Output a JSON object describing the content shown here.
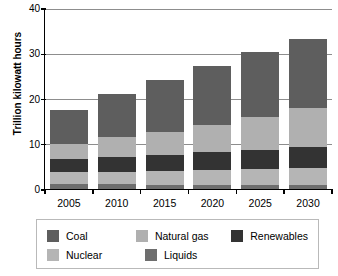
{
  "chart_data": {
    "type": "bar",
    "stacked": true,
    "title": "",
    "xlabel": "",
    "ylabel": "Trillion kilowatt hours",
    "categories": [
      "2005",
      "2010",
      "2015",
      "2020",
      "2025",
      "2030"
    ],
    "ylim": [
      0,
      40
    ],
    "yticks": [
      0,
      10,
      20,
      30,
      40
    ],
    "ytick_labels": [
      "0",
      "10",
      "20",
      "30",
      "40"
    ],
    "grid": true,
    "legend_position": "bottom",
    "stack_order_bottom_to_top": [
      "Liquids",
      "Nuclear",
      "Renewables",
      "Natural gas",
      "Coal"
    ],
    "series": [
      {
        "name": "Liquids",
        "color": "#6e6e6e",
        "values": [
          1.0,
          1.0,
          0.9,
          0.9,
          0.9,
          0.9
        ]
      },
      {
        "name": "Nuclear",
        "color": "#b5b5b5",
        "values": [
          2.7,
          2.8,
          3.0,
          3.4,
          3.6,
          3.8
        ]
      },
      {
        "name": "Renewables",
        "color": "#333333",
        "values": [
          3.0,
          3.3,
          3.6,
          3.9,
          4.2,
          4.5
        ]
      },
      {
        "name": "Natural gas",
        "color": "#b0b0b0",
        "values": [
          3.3,
          4.3,
          5.0,
          6.0,
          7.3,
          8.8
        ]
      },
      {
        "name": "Coal",
        "color": "#5e5e5e",
        "values": [
          7.5,
          9.6,
          11.5,
          13.0,
          14.3,
          15.2
        ]
      }
    ],
    "totals": [
      17.5,
      21.0,
      24.0,
      27.2,
      30.3,
      33.2
    ]
  },
  "legend": {
    "rows": [
      [
        {
          "label": "Coal",
          "color": "#5e5e5e"
        },
        {
          "label": "Natural gas",
          "color": "#b0b0b0"
        },
        {
          "label": "Renewables",
          "color": "#333333"
        }
      ],
      [
        {
          "label": "Nuclear",
          "color": "#b5b5b5"
        },
        {
          "label": "Liquids",
          "color": "#6e6e6e"
        }
      ]
    ]
  }
}
